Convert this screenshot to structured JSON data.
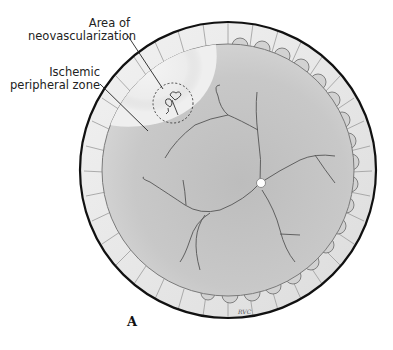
{
  "figure": {
    "panel_letter": "A",
    "signature": "RVC"
  },
  "labels": [
    {
      "id": "neovascularization",
      "lines": [
        "Area of",
        "neovascularization"
      ]
    },
    {
      "id": "ischemic",
      "lines": [
        "Ischemic",
        "peripheral zone"
      ]
    }
  ],
  "colors": {
    "fundus": "#c9c9c9",
    "ischemic_zone": "#efefef",
    "rim": "#e8e8e8",
    "outline": "#111111",
    "vessels": "#555555"
  }
}
